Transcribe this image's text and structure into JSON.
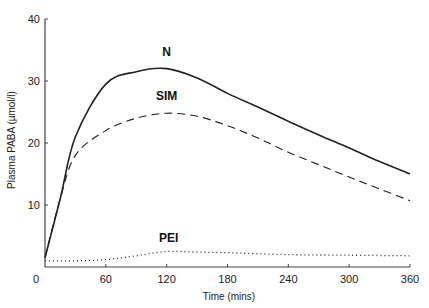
{
  "chart_data": {
    "type": "line",
    "title": "",
    "xlabel": "Time (mins)",
    "ylabel": "Plasma PABA (µmol/l)",
    "xlim": [
      0,
      360
    ],
    "ylim": [
      0,
      40
    ],
    "x_ticks": [
      0,
      60,
      120,
      180,
      240,
      300,
      360
    ],
    "y_ticks": [
      0,
      10,
      20,
      30,
      40
    ],
    "grid": false,
    "legend": "inline labels",
    "series": [
      {
        "name": "N",
        "style": "solid",
        "x": [
          0,
          15,
          30,
          60,
          90,
          120,
          150,
          180,
          210,
          240,
          270,
          300,
          330,
          360
        ],
        "values": [
          1.5,
          11,
          21,
          29.5,
          31.5,
          32,
          30.5,
          28,
          25.8,
          23.5,
          21.3,
          19.2,
          17,
          15
        ]
      },
      {
        "name": "SIM",
        "style": "dashed",
        "x": [
          0,
          15,
          30,
          60,
          90,
          120,
          150,
          180,
          210,
          240,
          270,
          300,
          330,
          360
        ],
        "values": [
          1.5,
          11,
          18,
          22,
          24,
          24.8,
          24.3,
          22.8,
          20.8,
          18.5,
          16.5,
          14.5,
          12.6,
          10.7
        ]
      },
      {
        "name": "PEI",
        "style": "dotted",
        "x": [
          0,
          30,
          60,
          90,
          120,
          150,
          180,
          240,
          300,
          360
        ],
        "values": [
          1.0,
          1.0,
          1.2,
          1.8,
          2.5,
          2.4,
          2.3,
          2.0,
          1.9,
          1.8
        ]
      }
    ],
    "annotations": [
      {
        "text": "N",
        "x": 120,
        "y": 34
      },
      {
        "text": "SIM",
        "x": 120,
        "y": 27
      },
      {
        "text": "PEI",
        "x": 122,
        "y": 4
      }
    ]
  }
}
